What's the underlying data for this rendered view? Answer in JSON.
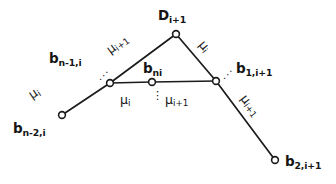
{
  "figure": {
    "type": "graph-diagram",
    "title": "",
    "background_color": "#ffffff",
    "stroke_color": "#1b1b1b",
    "text_color": "#141414"
  },
  "nodes": [
    {
      "id": "D_i+1",
      "base": "D",
      "sub": "i+1",
      "x": 176,
      "y": 34,
      "label_x": 158,
      "label_y": 9,
      "role": "apex-node"
    },
    {
      "id": "b_n-1,i",
      "base": "b",
      "sub": "n-1,i",
      "x": 110,
      "y": 83,
      "label_x": 49,
      "label_y": 52,
      "role": "left-junction-node"
    },
    {
      "id": "b_ni",
      "base": "b",
      "sub": "ni",
      "x": 152,
      "y": 82,
      "label_x": 143,
      "label_y": 62,
      "role": "middle-node"
    },
    {
      "id": "b_1,i+1",
      "base": "b",
      "sub": "1,i+1",
      "x": 216,
      "y": 81,
      "label_x": 236,
      "label_y": 62,
      "role": "right-junction-node"
    },
    {
      "id": "b_n-2,i",
      "base": "b",
      "sub": "n-2,i",
      "x": 62,
      "y": 115,
      "label_x": 13,
      "label_y": 122,
      "role": "lower-left-endpoint-node"
    },
    {
      "id": "b_2,i+1",
      "base": "b",
      "sub": "2,i+1",
      "x": 275,
      "y": 160,
      "label_x": 285,
      "label_y": 155,
      "role": "lower-right-endpoint-node"
    }
  ],
  "edges": [
    {
      "id": "edge-lower-left",
      "from": "b_n-2,i",
      "to": "b_n-1,i",
      "x1": 62,
      "y1": 115,
      "x2": 110,
      "y2": 83
    },
    {
      "id": "edge-upper-left",
      "from": "b_n-1,i",
      "to": "D_i+1",
      "x1": 110,
      "y1": 83,
      "x2": 176,
      "y2": 34
    },
    {
      "id": "edge-upper-right",
      "from": "D_i+1",
      "to": "b_1,i+1",
      "x1": 176,
      "y1": 34,
      "x2": 216,
      "y2": 81
    },
    {
      "id": "edge-lower-right",
      "from": "b_1,i+1",
      "to": "b_2,i+1",
      "x1": 216,
      "y1": 81,
      "x2": 275,
      "y2": 160
    },
    {
      "id": "edge-base-left",
      "from": "b_n-1,i",
      "to": "b_ni",
      "x1": 110,
      "y1": 83,
      "x2": 152,
      "y2": 82
    },
    {
      "id": "edge-base-right",
      "from": "b_ni",
      "to": "b_1,i+1",
      "x1": 152,
      "y1": 82,
      "x2": 216,
      "y2": 81
    }
  ],
  "edge_labels": [
    {
      "id": "mu-lower-left",
      "base": "μ",
      "sub": "i",
      "x": 30,
      "y": 90,
      "rotate": -34,
      "edge": "edge-lower-left"
    },
    {
      "id": "mu-upper-left",
      "base": "μ",
      "sub": "i+1",
      "x": 108,
      "y": 45,
      "rotate": -36,
      "edge": "edge-upper-left"
    },
    {
      "id": "mu-upper-right",
      "base": "μ",
      "sub": "i",
      "x": 201,
      "y": 36,
      "rotate": 50,
      "edge": "edge-upper-right"
    },
    {
      "id": "mu-lower-right",
      "base": "μ",
      "sub": "i+1",
      "x": 243,
      "y": 90,
      "rotate": 53,
      "edge": "edge-lower-right"
    }
  ],
  "flat_labels": [
    {
      "id": "mu-base-left",
      "base": "μ",
      "sub": "i",
      "x": 120,
      "y": 94
    },
    {
      "id": "mu-base-right",
      "base": "μ",
      "sub": "i+1",
      "x": 165,
      "y": 94
    }
  ],
  "ellipses": [
    {
      "id": "dots-left-junction",
      "glyph": "⋰",
      "x": 99,
      "y": 71,
      "style": "dots-tilt"
    },
    {
      "id": "dots-right-junction",
      "glyph": "⋰",
      "x": 223,
      "y": 70,
      "style": "dots-tilt"
    },
    {
      "id": "dots-base-center",
      "glyph": "⋮",
      "x": 152,
      "y": 90,
      "style": "dots-vert"
    }
  ],
  "node_radius": 3.4
}
